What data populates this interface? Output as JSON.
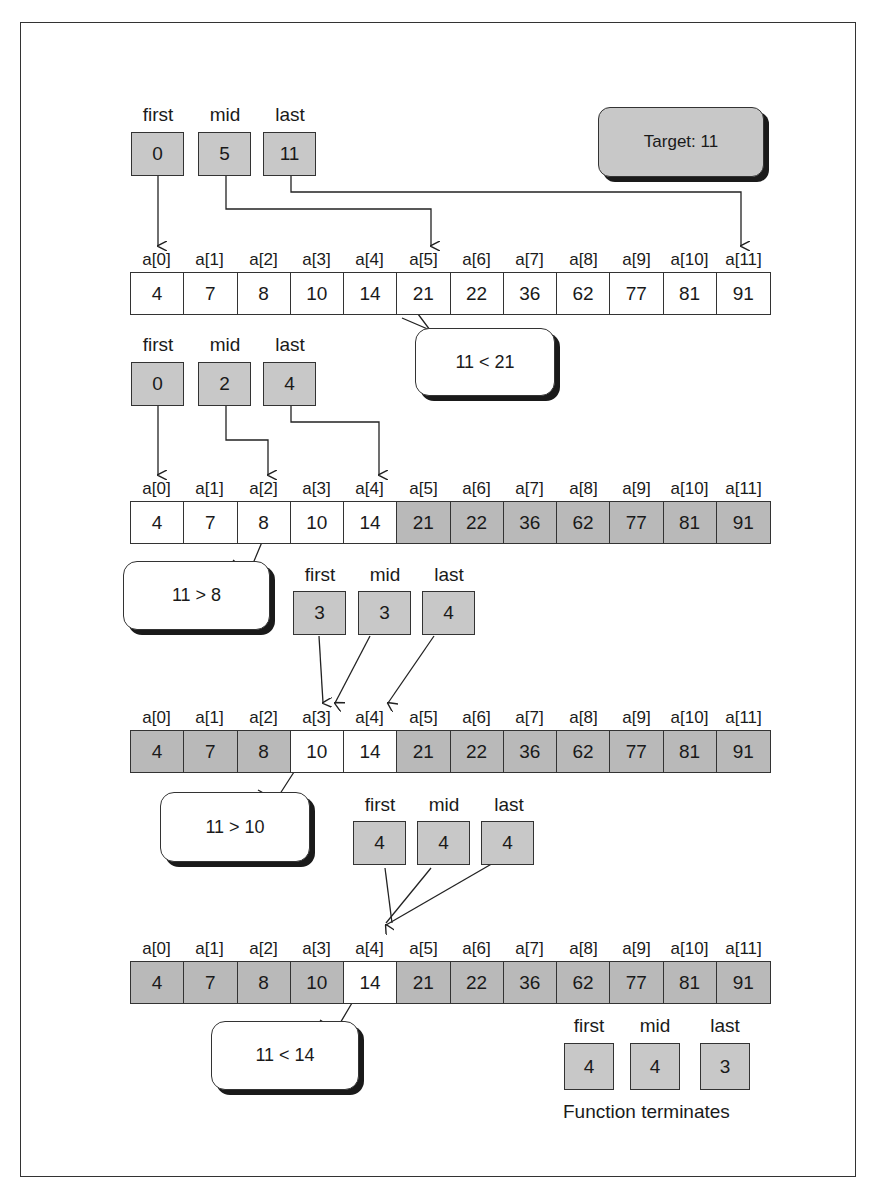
{
  "target": {
    "label": "Target: 11"
  },
  "var_labels": {
    "first": "first",
    "mid": "mid",
    "last": "last"
  },
  "index_labels": [
    "a[0]",
    "a[1]",
    "a[2]",
    "a[3]",
    "a[4]",
    "a[5]",
    "a[6]",
    "a[7]",
    "a[8]",
    "a[9]",
    "a[10]",
    "a[11]"
  ],
  "array_values": [
    "4",
    "7",
    "8",
    "10",
    "14",
    "21",
    "22",
    "36",
    "62",
    "77",
    "81",
    "91"
  ],
  "steps": [
    {
      "first": "0",
      "mid": "5",
      "last": "11",
      "comparison": "11  <  21",
      "active_range": [
        0,
        11
      ]
    },
    {
      "first": "0",
      "mid": "2",
      "last": "4",
      "comparison": "11  >  8",
      "active_range": [
        0,
        4
      ]
    },
    {
      "first": "3",
      "mid": "3",
      "last": "4",
      "comparison": "11  >  10",
      "active_range": [
        3,
        4
      ]
    },
    {
      "first": "4",
      "mid": "4",
      "last": "4",
      "comparison": "11  <  14",
      "active_range": [
        4,
        4
      ]
    },
    {
      "first": "4",
      "mid": "4",
      "last": "3"
    }
  ],
  "termination": {
    "label": "Function terminates"
  },
  "colors": {
    "var_box": "#c8c8c8",
    "dim_cell": "#b9b9b9",
    "active_cell": "#ffffff",
    "stroke": "#333333"
  }
}
